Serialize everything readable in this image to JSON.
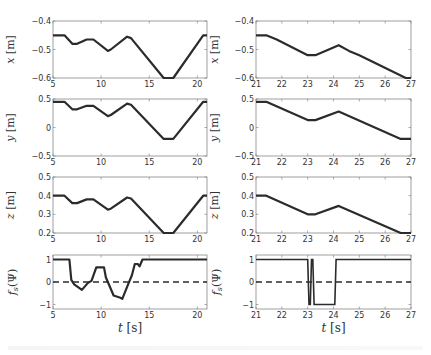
{
  "figure": {
    "left_xlabel": "t [s]",
    "right_xlabel": "t [s]"
  },
  "chart_data": [
    {
      "type": "line",
      "panel": "left-x",
      "ylabel": "x [m]",
      "xlabel": "",
      "xlim": [
        5,
        21
      ],
      "ylim": [
        -0.6,
        -0.4
      ],
      "xticks": [
        5,
        10,
        15,
        20
      ],
      "yticks": [
        -0.4,
        -0.5,
        -0.6
      ],
      "series": [
        {
          "name": "x",
          "x": [
            5,
            6.2,
            7,
            7.5,
            8.5,
            9.2,
            10.7,
            11,
            12.7,
            13.1,
            16.5,
            17.5,
            20.6,
            21
          ],
          "values": [
            -0.45,
            -0.45,
            -0.48,
            -0.48,
            -0.465,
            -0.465,
            -0.505,
            -0.5,
            -0.455,
            -0.46,
            -0.6,
            -0.6,
            -0.45,
            -0.45
          ]
        }
      ]
    },
    {
      "type": "line",
      "panel": "right-x",
      "ylabel": "x [m]",
      "xlabel": "",
      "xlim": [
        21,
        27
      ],
      "ylim": [
        -0.6,
        -0.4
      ],
      "xticks": [
        21,
        22,
        23,
        24,
        25,
        26,
        27
      ],
      "yticks": [
        -0.4,
        -0.5,
        -0.6
      ],
      "series": [
        {
          "name": "x",
          "x": [
            21,
            21.4,
            21.8,
            23.0,
            23.3,
            24.2,
            24.6,
            25,
            26.8,
            27
          ],
          "values": [
            -0.45,
            -0.45,
            -0.465,
            -0.52,
            -0.52,
            -0.485,
            -0.505,
            -0.52,
            -0.6,
            -0.6
          ]
        }
      ]
    },
    {
      "type": "line",
      "panel": "left-y",
      "ylabel": "y [m]",
      "xlabel": "",
      "xlim": [
        5,
        21
      ],
      "ylim": [
        -0.5,
        0.5
      ],
      "xticks": [
        5,
        10,
        15,
        20
      ],
      "yticks": [
        0.5,
        0,
        -0.5
      ],
      "series": [
        {
          "name": "y",
          "x": [
            5,
            6.2,
            7,
            7.5,
            8.5,
            9.2,
            10.7,
            11,
            12.7,
            13.1,
            16.5,
            17.5,
            20.6,
            21
          ],
          "values": [
            0.45,
            0.45,
            0.32,
            0.32,
            0.38,
            0.38,
            0.2,
            0.22,
            0.42,
            0.4,
            -0.2,
            -0.2,
            0.45,
            0.45
          ]
        }
      ]
    },
    {
      "type": "line",
      "panel": "right-y",
      "ylabel": "y [m]",
      "xlabel": "",
      "xlim": [
        21,
        27
      ],
      "ylim": [
        -0.5,
        0.5
      ],
      "xticks": [
        21,
        22,
        23,
        24,
        25,
        26,
        27
      ],
      "yticks": [
        0.5,
        0,
        -0.5
      ],
      "series": [
        {
          "name": "y",
          "x": [
            21,
            21.4,
            23.0,
            23.3,
            24.2,
            26.6,
            27
          ],
          "values": [
            0.45,
            0.45,
            0.13,
            0.13,
            0.28,
            -0.2,
            -0.2
          ]
        }
      ]
    },
    {
      "type": "line",
      "panel": "left-z",
      "ylabel": "z [m]",
      "xlabel": "",
      "xlim": [
        5,
        21
      ],
      "ylim": [
        0.2,
        0.5
      ],
      "xticks": [
        5,
        10,
        15,
        20
      ],
      "yticks": [
        0.5,
        0.4,
        0.3,
        0.2
      ],
      "series": [
        {
          "name": "z",
          "x": [
            5,
            6.2,
            7,
            7.5,
            8.5,
            9.2,
            10.7,
            11,
            12.7,
            13.1,
            16.5,
            17.5,
            20.6,
            21
          ],
          "values": [
            0.4,
            0.4,
            0.36,
            0.36,
            0.38,
            0.38,
            0.325,
            0.33,
            0.39,
            0.385,
            0.2,
            0.2,
            0.4,
            0.4
          ]
        }
      ]
    },
    {
      "type": "line",
      "panel": "right-z",
      "ylabel": "z [m]",
      "xlabel": "",
      "xlim": [
        21,
        27
      ],
      "ylim": [
        0.2,
        0.5
      ],
      "xticks": [
        21,
        22,
        23,
        24,
        25,
        26,
        27
      ],
      "yticks": [
        0.5,
        0.4,
        0.3,
        0.2
      ],
      "series": [
        {
          "name": "z",
          "x": [
            21,
            21.4,
            23.0,
            23.3,
            24.2,
            26.6,
            27
          ],
          "values": [
            0.4,
            0.4,
            0.3,
            0.3,
            0.345,
            0.2,
            0.2
          ]
        }
      ]
    },
    {
      "type": "line",
      "panel": "left-fs",
      "ylabel": "f_s(Ψ)",
      "xlabel": "t [s]",
      "xlim": [
        5,
        21
      ],
      "ylim": [
        -1.2,
        1.2
      ],
      "xticks": [
        5,
        10,
        15,
        20
      ],
      "yticks": [
        1,
        0,
        -1
      ],
      "series": [
        {
          "name": "f_s",
          "style": "solid",
          "x": [
            5,
            6.7,
            6.9,
            7.2,
            8.0,
            8.6,
            9.0,
            9.5,
            10.3,
            10.5,
            10.8,
            11.3,
            12.0,
            12.2,
            12.8,
            13.2,
            13.5,
            13.8,
            14.0,
            14.3,
            21
          ],
          "values": [
            1,
            1,
            0.1,
            -0.1,
            -0.35,
            -0.05,
            0.05,
            0.65,
            0.65,
            0.2,
            -0.1,
            -0.6,
            -0.7,
            -0.75,
            -0.1,
            0.3,
            0.8,
            0.8,
            0.7,
            1,
            1
          ]
        },
        {
          "name": "threshold",
          "style": "dashed",
          "x": [
            5,
            21
          ],
          "values": [
            0,
            0
          ]
        }
      ]
    },
    {
      "type": "line",
      "panel": "right-fs",
      "ylabel": "f_s(Ψ)",
      "xlabel": "t [s]",
      "xlim": [
        21,
        27
      ],
      "ylim": [
        -1.2,
        1.2
      ],
      "xticks": [
        21,
        22,
        23,
        24,
        25,
        26,
        27
      ],
      "yticks": [
        1,
        0,
        -1
      ],
      "series": [
        {
          "name": "f_s",
          "style": "solid",
          "x": [
            21,
            23.0,
            23.05,
            23.1,
            23.15,
            23.2,
            23.25,
            23.3,
            24.05,
            24.1,
            27
          ],
          "values": [
            1,
            1,
            -1,
            -1,
            1,
            1,
            -1,
            -1,
            -1,
            1,
            1
          ]
        },
        {
          "name": "threshold",
          "style": "dashed",
          "x": [
            21,
            27
          ],
          "values": [
            0,
            0
          ]
        }
      ]
    }
  ]
}
